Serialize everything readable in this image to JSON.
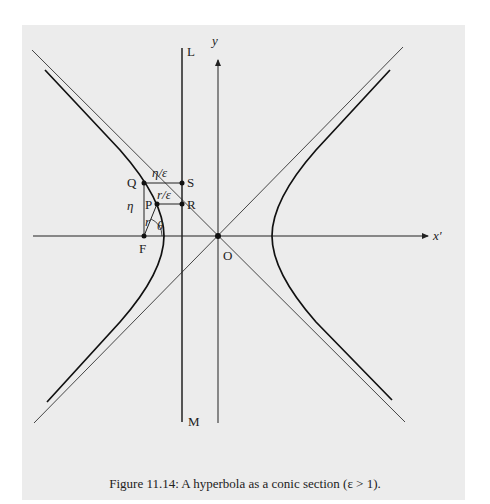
{
  "figure": {
    "caption": "Figure 11.14: A hyperbola as a conic section (ε > 1).",
    "labels": {
      "y_axis": "y",
      "x_axis": "x′",
      "line_top": "L",
      "line_bottom": "M",
      "point_Q": "Q",
      "point_S": "S",
      "point_P": "P",
      "point_R": "R",
      "point_F": "F",
      "origin": "O",
      "eta": "η",
      "eta_over_eps": "η/ε",
      "r_over_eps": "r/ε",
      "r": "r",
      "theta": "θ"
    }
  },
  "colors": {
    "background": "#ececec",
    "ink": "#222222"
  }
}
